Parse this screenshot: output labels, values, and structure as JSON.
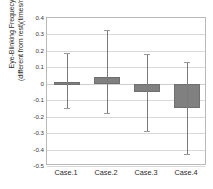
{
  "chart_data": {
    "type": "bar",
    "title": "",
    "xlabel": "",
    "ylabel_line1": "Eye-Blinking Frequecy",
    "ylabel_line2": "(different from rest)(times/min.)",
    "categories": [
      "Case.1",
      "Case.2",
      "Case.3",
      "Case.4"
    ],
    "values": [
      0.013,
      0.04,
      -0.05,
      -0.15
    ],
    "error_low": [
      -0.15,
      -0.18,
      -0.29,
      -0.43
    ],
    "error_high": [
      0.19,
      0.33,
      0.18,
      0.13
    ],
    "ylim": [
      -0.5,
      0.4
    ],
    "yticks": [
      "0.4",
      "0.3",
      "0.2",
      "0.1",
      "0",
      "-0.1",
      "-0.2",
      "-0.3",
      "-0.4",
      "-0.5"
    ],
    "ytick_values": [
      0.4,
      0.3,
      0.2,
      0.1,
      0,
      -0.1,
      -0.2,
      -0.3,
      -0.4,
      -0.5
    ],
    "grid": true,
    "legend": "none",
    "bar_color": "#808080",
    "error_color": "#7a7a7a",
    "grid_color": "#d9d9d9",
    "plot_border_color": "#b9b9b9"
  }
}
